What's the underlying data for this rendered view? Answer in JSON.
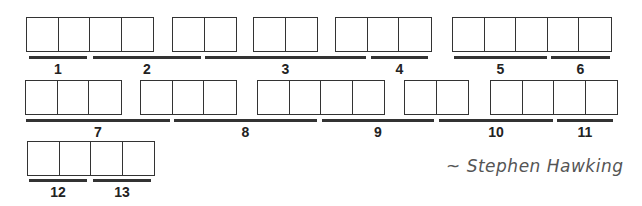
{
  "puzzle": {
    "type": "quote-letter-boxes",
    "rows": [
      {
        "groups": [
          {
            "x": 26,
            "y": 17,
            "cells": 4
          },
          {
            "x": 172,
            "y": 17,
            "cells": 2
          },
          {
            "x": 253,
            "y": 17,
            "cells": 2
          },
          {
            "x": 335,
            "y": 17,
            "cells": 3
          },
          {
            "x": 452,
            "y": 17,
            "cells": 5
          }
        ]
      },
      {
        "groups": [
          {
            "x": 25,
            "y": 80,
            "cells": 3
          },
          {
            "x": 140,
            "y": 80,
            "cells": 3
          },
          {
            "x": 257,
            "y": 80,
            "cells": 4
          },
          {
            "x": 404,
            "y": 80,
            "cells": 2
          },
          {
            "x": 490,
            "y": 80,
            "cells": 4
          }
        ]
      },
      {
        "groups": [
          {
            "x": 27,
            "y": 141,
            "cells": 4
          }
        ]
      }
    ],
    "clues": [
      {
        "number": "1",
        "x1": 29,
        "x2": 87,
        "y": 56
      },
      {
        "number": "2",
        "x1": 93,
        "x2": 201,
        "y": 56
      },
      {
        "number": "3",
        "x1": 205,
        "x2": 366,
        "y": 56
      },
      {
        "number": "4",
        "x1": 371,
        "x2": 428,
        "y": 56
      },
      {
        "number": "5",
        "x1": 454,
        "x2": 547,
        "y": 56
      },
      {
        "number": "6",
        "x1": 551,
        "x2": 610,
        "y": 56
      },
      {
        "number": "7",
        "x1": 26,
        "x2": 170,
        "y": 119
      },
      {
        "number": "8",
        "x1": 174,
        "x2": 317,
        "y": 119
      },
      {
        "number": "9",
        "x1": 322,
        "x2": 434,
        "y": 119
      },
      {
        "number": "10",
        "x1": 439,
        "x2": 553,
        "y": 119
      },
      {
        "number": "11",
        "x1": 557,
        "x2": 613,
        "y": 119
      },
      {
        "number": "12",
        "x1": 29,
        "x2": 87,
        "y": 179
      },
      {
        "number": "13",
        "x1": 93,
        "x2": 151,
        "y": 179
      }
    ]
  },
  "attribution": "~ Stephen Hawking",
  "colors": {
    "line": "#333333",
    "text": "#222222",
    "author": "#555555"
  }
}
